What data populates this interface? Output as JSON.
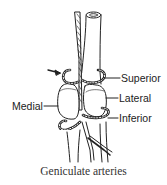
{
  "diagram": {
    "caption": "Geniculate arteries",
    "labels": {
      "superior": "Superior",
      "lateral": "Lateral",
      "medial": "Medial",
      "inferior": "Inferior"
    },
    "arrows": [
      {
        "name": "upper-left-arrow",
        "points_to": "superior medial loop"
      },
      {
        "name": "lower-left-arrow",
        "points_to": "inferior medial loop"
      }
    ],
    "colors": {
      "line": "#222222",
      "background": "#ffffff"
    }
  }
}
